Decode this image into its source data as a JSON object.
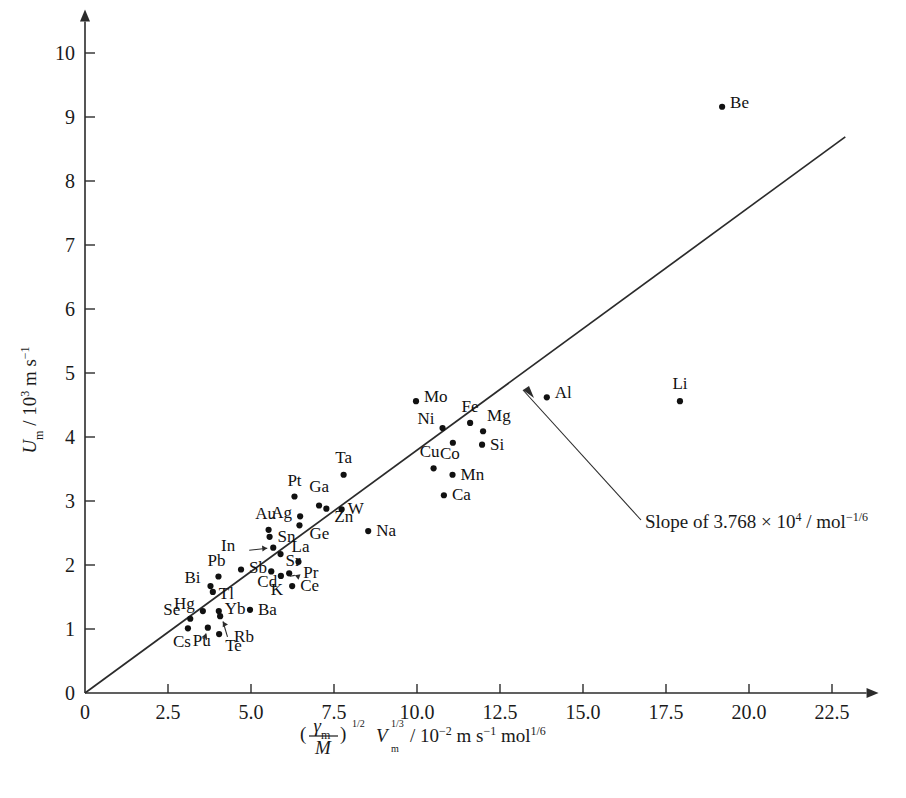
{
  "chart_data": {
    "type": "scatter",
    "title": "",
    "xlabel": "(γₘ/M)^(1/2) Vₘ^(1/3) / 10⁻² m s⁻¹ mol^(1/6)",
    "ylabel": "Uₘ / 10³ m s⁻¹",
    "xlim": [
      0,
      23.3
    ],
    "ylim": [
      0,
      10.4
    ],
    "xticks": [
      "0",
      "2.5",
      "5.0",
      "7.5",
      "10.0",
      "12.5",
      "15.0",
      "17.5",
      "20.0",
      "22.5"
    ],
    "xtick_values": [
      0,
      2.5,
      5.0,
      7.5,
      10.0,
      12.5,
      15.0,
      17.5,
      20.0,
      22.5
    ],
    "yticks": [
      "0",
      "1",
      "2",
      "3",
      "4",
      "5",
      "6",
      "7",
      "8",
      "9",
      "10"
    ],
    "ytick_values": [
      0,
      1,
      2,
      3,
      4,
      5,
      6,
      7,
      8,
      9,
      10
    ],
    "grid": false,
    "legend": "none",
    "marker_color": "#111111",
    "line_color": "#2b2b2b",
    "trendline": {
      "label": "Slope of 3.768 × 10⁴ / mol⁻¹ᐟ⁶",
      "slope_text_value": "3.768 × 10⁴",
      "slope_units": "mol⁻¹ᐟ⁶",
      "x_start": 0.0,
      "y_start": 0.0,
      "x_end": 22.9,
      "y_end": 8.69
    },
    "points": [
      {
        "label": "Be",
        "x": 19.19,
        "y": 9.16,
        "lx": 8,
        "ly": 1,
        "anchor": "start"
      },
      {
        "label": "Li",
        "x": 17.92,
        "y": 4.56,
        "lx": 0,
        "ly": -12,
        "anchor": "middle"
      },
      {
        "label": "Al",
        "x": 13.91,
        "y": 4.62,
        "lx": 8,
        "ly": 1,
        "anchor": "start"
      },
      {
        "label": "Mo",
        "x": 9.97,
        "y": 4.56,
        "lx": 8,
        "ly": 1,
        "anchor": "start"
      },
      {
        "label": "Ni",
        "x": 10.77,
        "y": 4.14,
        "lx": -8,
        "ly": -4,
        "anchor": "end"
      },
      {
        "label": "Fe",
        "x": 11.6,
        "y": 4.22,
        "lx": 0,
        "ly": -11,
        "anchor": "middle"
      },
      {
        "label": "Mg",
        "x": 11.99,
        "y": 4.09,
        "lx": 4,
        "ly": -10,
        "anchor": "start"
      },
      {
        "label": "Co",
        "x": 11.08,
        "y": 3.91,
        "lx": -3,
        "ly": 16,
        "anchor": "middle"
      },
      {
        "label": "Si",
        "x": 11.96,
        "y": 3.88,
        "lx": 8,
        "ly": 5,
        "anchor": "start"
      },
      {
        "label": "Cu",
        "x": 10.5,
        "y": 3.51,
        "lx": -4,
        "ly": -11,
        "anchor": "middle"
      },
      {
        "label": "Mn",
        "x": 11.07,
        "y": 3.41,
        "lx": 8,
        "ly": 5,
        "anchor": "start"
      },
      {
        "label": "Ta",
        "x": 7.79,
        "y": 3.41,
        "lx": 0,
        "ly": -12,
        "anchor": "middle"
      },
      {
        "label": "Ca",
        "x": 10.81,
        "y": 3.09,
        "lx": 8,
        "ly": 5,
        "anchor": "start"
      },
      {
        "label": "Pt",
        "x": 6.31,
        "y": 3.07,
        "lx": 0,
        "ly": -11,
        "anchor": "middle"
      },
      {
        "label": "Ga",
        "x": 7.05,
        "y": 2.93,
        "lx": 0,
        "ly": -13,
        "anchor": "middle"
      },
      {
        "label": "Zn",
        "x": 7.27,
        "y": 2.88,
        "lx": 8,
        "ly": 13,
        "anchor": "start"
      },
      {
        "label": "W",
        "x": 7.73,
        "y": 2.87,
        "lx": 6,
        "ly": 5,
        "anchor": "start"
      },
      {
        "label": "Ag",
        "x": 6.48,
        "y": 2.76,
        "lx": -8,
        "ly": 2,
        "anchor": "end"
      },
      {
        "label": "Ge",
        "x": 6.46,
        "y": 2.62,
        "lx": 10,
        "ly": 14,
        "anchor": "start"
      },
      {
        "label": "Na",
        "x": 8.53,
        "y": 2.53,
        "lx": 8,
        "ly": 5,
        "anchor": "start"
      },
      {
        "label": "Au",
        "x": 5.53,
        "y": 2.55,
        "lx": -3,
        "ly": -11,
        "anchor": "middle"
      },
      {
        "label": "Sn",
        "x": 5.56,
        "y": 2.44,
        "lx": 8,
        "ly": 5,
        "anchor": "start"
      },
      {
        "label": "In",
        "x": 5.67,
        "y": 2.27,
        "lx": -38,
        "ly": 3,
        "anchor": "end",
        "arrow": true
      },
      {
        "label": "Sr",
        "x": 5.89,
        "y": 2.17,
        "lx": 5,
        "ly": 12,
        "anchor": "start"
      },
      {
        "label": "La",
        "x": 6.43,
        "y": 2.05,
        "lx": 2,
        "ly": -10,
        "anchor": "middle"
      },
      {
        "label": "Cd",
        "x": 5.61,
        "y": 1.9,
        "lx": -4,
        "ly": 16,
        "anchor": "middle"
      },
      {
        "label": "Pr",
        "x": 6.15,
        "y": 1.87,
        "lx": 14,
        "ly": 5,
        "anchor": "start",
        "arrow": true
      },
      {
        "label": "K",
        "x": 5.9,
        "y": 1.83,
        "lx": -4,
        "ly": 19,
        "anchor": "middle"
      },
      {
        "label": "Sb",
        "x": 4.7,
        "y": 1.93,
        "lx": 8,
        "ly": 4,
        "anchor": "start"
      },
      {
        "label": "Pb",
        "x": 4.02,
        "y": 1.82,
        "lx": -2,
        "ly": -11,
        "anchor": "middle"
      },
      {
        "label": "Ce",
        "x": 6.24,
        "y": 1.67,
        "lx": 8,
        "ly": 5,
        "anchor": "start"
      },
      {
        "label": "Bi",
        "x": 3.78,
        "y": 1.67,
        "lx": -10,
        "ly": -3,
        "anchor": "end"
      },
      {
        "label": "Tl",
        "x": 3.85,
        "y": 1.58,
        "lx": 6,
        "ly": 7,
        "anchor": "start"
      },
      {
        "label": "Ba",
        "x": 4.97,
        "y": 1.3,
        "lx": 8,
        "ly": 5,
        "anchor": "start"
      },
      {
        "label": "Yb",
        "x": 4.03,
        "y": 1.28,
        "lx": 6,
        "ly": 3,
        "anchor": "start"
      },
      {
        "label": "Hg",
        "x": 3.55,
        "y": 1.28,
        "lx": -8,
        "ly": -2,
        "anchor": "end"
      },
      {
        "label": "Se",
        "x": 3.17,
        "y": 1.16,
        "lx": -10,
        "ly": -4,
        "anchor": "end"
      },
      {
        "label": "Rb",
        "x": 4.07,
        "y": 1.2,
        "lx": 14,
        "ly": 26,
        "anchor": "start",
        "arrow": true
      },
      {
        "label": "Pu",
        "x": 3.7,
        "y": 1.02,
        "lx": -6,
        "ly": 18,
        "anchor": "middle",
        "arrow": true
      },
      {
        "label": "Cs",
        "x": 3.1,
        "y": 1.01,
        "lx": -6,
        "ly": 19,
        "anchor": "middle"
      },
      {
        "label": "Te",
        "x": 4.04,
        "y": 0.92,
        "lx": 6,
        "ly": 17,
        "anchor": "start"
      }
    ]
  },
  "annotation": {
    "text_prefix": "Slope of ",
    "mantissa": "3.768",
    "times": "×",
    "base": "10",
    "exponent": "4",
    "slash": " / ",
    "unit": "mol",
    "unit_exponent": "−1/6"
  },
  "axes": {
    "y_title_symbol": "U",
    "y_title_sub": "m",
    "y_title_rest": " / 10",
    "y_title_exp": "3",
    "y_title_tail": " m s",
    "y_title_tail_exp": "−1",
    "x_num_symbol": "γ",
    "x_num_sub": "m",
    "x_den_symbol": "M",
    "x_paren_exp": "1/2",
    "x_v_symbol": "V",
    "x_v_sub": "m",
    "x_v_exp": "1/3",
    "x_divider": " / 10",
    "x_div_exp": "−2",
    "x_units_a": " m s",
    "x_units_a_exp": "−1",
    "x_units_b": " mol",
    "x_units_b_exp": "1/6"
  }
}
